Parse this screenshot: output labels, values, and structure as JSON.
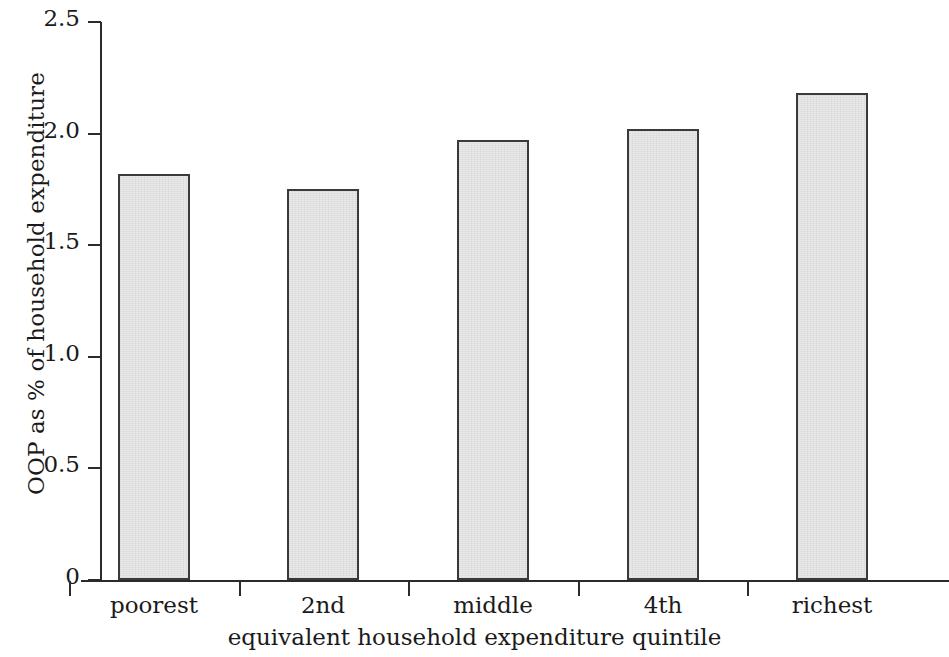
{
  "chart_data": {
    "type": "bar",
    "title": "",
    "xlabel": "equivalent household expenditure quintile",
    "ylabel": "OOP as % of household expenditure",
    "categories": [
      "poorest",
      "2nd",
      "middle",
      "4th",
      "richest"
    ],
    "values": [
      1.82,
      1.75,
      1.97,
      2.02,
      2.18
    ],
    "ylim": [
      0,
      2.5
    ],
    "ytick_labels": [
      "2.5",
      "2.0",
      "1.5",
      "1.0",
      "0.5",
      "0"
    ],
    "ytick_values": [
      2.5,
      2.0,
      1.5,
      1.0,
      0.5,
      0
    ],
    "grid": false,
    "legend": "none",
    "bar_fill_color": "#e9e9e9",
    "bar_edge_color": "#3a3a3a",
    "axis_color": "#2b2b2b"
  },
  "axes": {
    "y_title": "OOP as % of household expenditure",
    "x_title": "equivalent household expenditure quintile"
  }
}
